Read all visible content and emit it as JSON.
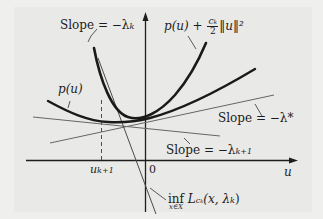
{
  "figure": {
    "axes": {
      "horizontal_label": "u",
      "origin_label": "0",
      "tick_label": "u",
      "tick_subscript": "k+1"
    },
    "labels": {
      "slope_lambda_k": {
        "prefix": "Slope = −λ",
        "subscript": "k"
      },
      "augmented_curve": {
        "prefix": "p(u) + ",
        "frac_num": "c",
        "frac_num_sub": "k",
        "frac_den": "2",
        "suffix": "‖u‖²"
      },
      "p_curve": "p(u)",
      "slope_lambda_star": "Slope = −λ*",
      "slope_lambda_k1": {
        "prefix": "Slope = −λ",
        "subscript": "k+1"
      },
      "inf_label": {
        "op": "inf",
        "under": "x∈X",
        "func": "L",
        "func_sub": "c",
        "func_sub_sub": "k",
        "args": "(x, λ",
        "args_sub": "k",
        "close": ")"
      }
    },
    "colors": {
      "background": "#efefed",
      "panel": "#e9e9e7",
      "bold_curve": "#1a1a1a",
      "thin_line": "#5a5a5a",
      "axis": "#1e1e1e"
    }
  }
}
